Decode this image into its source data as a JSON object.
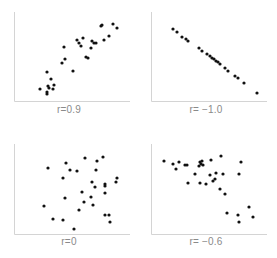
{
  "colors": {
    "axis": "#d4d4d4",
    "dot": "#111111",
    "label": "#8a8a8a",
    "background": "#ffffff"
  },
  "chart_data": [
    {
      "type": "scatter",
      "title": "",
      "label": "r=0.9",
      "correlation": 0.9,
      "xlabel": "",
      "ylabel": "",
      "grid": false,
      "points": [
        [
          40,
          89
        ],
        [
          47,
          94
        ],
        [
          47,
          92
        ],
        [
          49,
          88
        ],
        [
          48,
          86
        ],
        [
          53,
          89
        ],
        [
          51,
          79
        ],
        [
          54,
          85
        ],
        [
          47,
          72
        ],
        [
          62,
          63
        ],
        [
          65,
          59
        ],
        [
          64,
          47
        ],
        [
          73,
          71
        ],
        [
          77,
          40
        ],
        [
          79,
          43
        ],
        [
          81,
          46
        ],
        [
          83,
          38
        ],
        [
          92,
          41
        ],
        [
          91,
          48
        ],
        [
          94,
          43
        ],
        [
          96,
          43
        ],
        [
          86,
          57
        ],
        [
          88,
          58
        ],
        [
          101,
          26
        ],
        [
          102,
          25
        ],
        [
          104,
          40
        ],
        [
          109,
          36
        ],
        [
          113,
          24
        ],
        [
          117,
          28
        ]
      ]
    },
    {
      "type": "scatter",
      "title": "",
      "label": "r= −1.0",
      "correlation": -1.0,
      "xlabel": "",
      "ylabel": "",
      "grid": false,
      "points": [
        [
          36,
          29
        ],
        [
          40,
          32
        ],
        [
          45,
          37
        ],
        [
          49,
          39
        ],
        [
          51,
          41
        ],
        [
          62,
          48
        ],
        [
          65,
          51
        ],
        [
          70,
          54
        ],
        [
          73,
          56
        ],
        [
          75,
          58
        ],
        [
          77,
          59
        ],
        [
          79,
          61
        ],
        [
          81,
          62
        ],
        [
          83,
          64
        ],
        [
          88,
          68
        ],
        [
          91,
          71
        ],
        [
          98,
          76
        ],
        [
          101,
          78
        ],
        [
          107,
          83
        ],
        [
          120,
          93
        ]
      ]
    },
    {
      "type": "scatter",
      "title": "",
      "label": "r=0",
      "correlation": 0,
      "xlabel": "",
      "ylabel": "",
      "grid": false,
      "points": [
        [
          48,
          37
        ],
        [
          66,
          32
        ],
        [
          70,
          39
        ],
        [
          77,
          40
        ],
        [
          63,
          47
        ],
        [
          85,
          27
        ],
        [
          97,
          30
        ],
        [
          103,
          26
        ],
        [
          96,
          39
        ],
        [
          92,
          51
        ],
        [
          95,
          56
        ],
        [
          105,
          53
        ],
        [
          105,
          55
        ],
        [
          105,
          62
        ],
        [
          116,
          51
        ],
        [
          117,
          47
        ],
        [
          82,
          61
        ],
        [
          91,
          66
        ],
        [
          65,
          67
        ],
        [
          84,
          71
        ],
        [
          93,
          74
        ],
        [
          79,
          79
        ],
        [
          44,
          75
        ],
        [
          53,
          88
        ],
        [
          63,
          89
        ],
        [
          74,
          98
        ],
        [
          105,
          84
        ],
        [
          109,
          84
        ],
        [
          110,
          91
        ]
      ]
    },
    {
      "type": "scatter",
      "title": "",
      "label": "r= −0.6",
      "correlation": -0.6,
      "xlabel": "",
      "ylabel": "",
      "grid": false,
      "points": [
        [
          27,
          30
        ],
        [
          36,
          33
        ],
        [
          42,
          31
        ],
        [
          39,
          38
        ],
        [
          48,
          34
        ],
        [
          50,
          34
        ],
        [
          63,
          31
        ],
        [
          64,
          33
        ],
        [
          66,
          34
        ],
        [
          65,
          30
        ],
        [
          62,
          35
        ],
        [
          74,
          29
        ],
        [
          84,
          25
        ],
        [
          58,
          43
        ],
        [
          73,
          44
        ],
        [
          79,
          42
        ],
        [
          78,
          48
        ],
        [
          76,
          50
        ],
        [
          86,
          43
        ],
        [
          102,
          43
        ],
        [
          104,
          31
        ],
        [
          51,
          52
        ],
        [
          63,
          52
        ],
        [
          69,
          53
        ],
        [
          83,
          58
        ],
        [
          88,
          63
        ],
        [
          90,
          82
        ],
        [
          101,
          84
        ],
        [
          102,
          91
        ],
        [
          112,
          76
        ],
        [
          116,
          86
        ]
      ]
    }
  ]
}
